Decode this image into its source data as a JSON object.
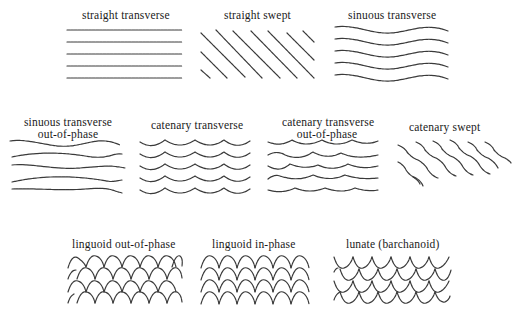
{
  "figure": {
    "rows": [
      {
        "panels": [
          {
            "id": "straight-transverse",
            "label": "straight transverse"
          },
          {
            "id": "straight-swept",
            "label": "straight swept"
          },
          {
            "id": "sinuous-transverse",
            "label": "sinuous transverse"
          }
        ]
      },
      {
        "panels": [
          {
            "id": "sinuous-transverse-out-of-phase",
            "label_line1": "sinuous transverse",
            "label_line2": "out-of-phase"
          },
          {
            "id": "catenary-transverse",
            "label": "catenary transverse"
          },
          {
            "id": "catenary-transverse-out-of-phase",
            "label_line1": "catenary transverse",
            "label_line2": "out-of-phase"
          },
          {
            "id": "catenary-swept",
            "label": "catenary   swept"
          }
        ]
      },
      {
        "panels": [
          {
            "id": "linguoid-out-of-phase",
            "label": "linguoid out-of-phase"
          },
          {
            "id": "linguoid-in-phase",
            "label": "linguoid in-phase"
          },
          {
            "id": "lunate",
            "label": "lunate (barchanoid)"
          }
        ]
      }
    ],
    "line_color": "#3a3a3a",
    "text_color": "#1a1a1a",
    "background": "#ffffff"
  }
}
